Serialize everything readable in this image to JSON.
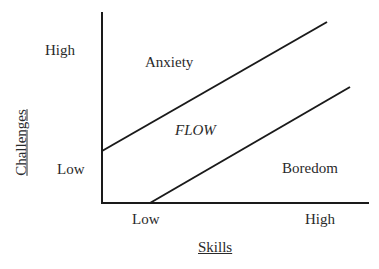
{
  "diagram": {
    "type": "flow-channel",
    "y_axis": {
      "label": "Challenges",
      "ticks": [
        "High",
        "Low"
      ]
    },
    "x_axis": {
      "label": "Skills",
      "ticks": [
        "Low",
        "High"
      ]
    },
    "regions": {
      "upper": "Anxiety",
      "middle": "FLOW",
      "lower": "Boredom"
    },
    "lines": [
      {
        "name": "upper-boundary",
        "from": [
          102,
          151
        ],
        "to": [
          327,
          22
        ]
      },
      {
        "name": "lower-boundary",
        "from": [
          150,
          203
        ],
        "to": [
          350,
          87
        ]
      }
    ],
    "colors": {
      "line": "#1a1a1a",
      "text": "#2a2a2a",
      "background": "#ffffff"
    }
  }
}
